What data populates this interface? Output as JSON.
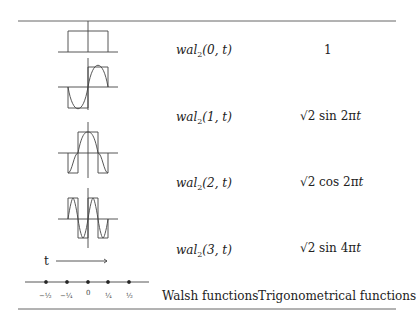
{
  "rows": [
    {
      "walsh_fn": "wal",
      "walsh_sub": "2",
      "walsh_args": "(0, t)",
      "trig": "1"
    },
    {
      "walsh_fn": "wal",
      "walsh_sub": "2",
      "walsh_args": "(1, t)",
      "trig_sqrt": "√2",
      "trig_fn": "sin 2π",
      "trig_var": "t"
    },
    {
      "walsh_fn": "wal",
      "walsh_sub": "2",
      "walsh_args": "(2, t)",
      "trig_sqrt": "√2",
      "trig_fn": "cos 2π",
      "trig_var": "t"
    },
    {
      "walsh_fn": "wal",
      "walsh_sub": "2",
      "walsh_args": "(3, t)",
      "trig_sqrt": "√2",
      "trig_fn": "sin 4π",
      "trig_var": "t"
    }
  ],
  "axis": {
    "t_label": "t",
    "ticks": [
      "−½",
      "−¼",
      "0",
      "¼",
      "½"
    ]
  },
  "headers": {
    "walsh": "Walsh functions",
    "trig": "Trigonometrical functions"
  }
}
